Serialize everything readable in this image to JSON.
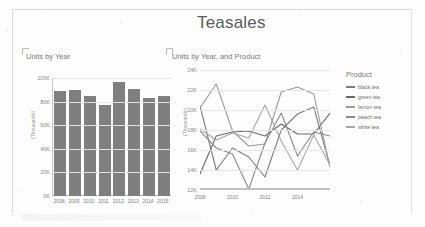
{
  "report": {
    "title": "Teasales"
  },
  "bar_panel": {
    "title": "Units by Year",
    "y_axis_label": "(Thousands)"
  },
  "line_panel": {
    "title": "Units by Year, and Product",
    "y_axis_label": "(Thousands)"
  },
  "legend": {
    "title": "Product",
    "items": [
      {
        "label": "black tea",
        "color": "#7d7d7d"
      },
      {
        "label": "green tea",
        "color": "#6a6a6a"
      },
      {
        "label": "lemon tea",
        "color": "#9a9a9a"
      },
      {
        "label": "peach tea",
        "color": "#8a8a8a"
      },
      {
        "label": "white tea",
        "color": "#a8a8a8"
      }
    ]
  },
  "chart_data": [
    {
      "id": "units-by-year",
      "type": "bar",
      "title": "Units by Year",
      "xlabel": "",
      "ylabel": "(Thousands)",
      "categories": [
        "2008",
        "2009",
        "2010",
        "2011",
        "2012",
        "2013",
        "2014",
        "2015"
      ],
      "values": [
        89000,
        90000,
        85000,
        77000,
        97000,
        91000,
        83000,
        85000
      ],
      "ylim": [
        0,
        100000
      ],
      "yticks": [
        0,
        20000,
        40000,
        60000,
        80000,
        100000
      ],
      "ytick_labels": [
        "0K",
        "20K",
        "40K",
        "60K",
        "80K",
        "100K"
      ],
      "grid": true,
      "bar_color": "#7f7f7f",
      "legend": false
    },
    {
      "id": "units-by-year-and-product",
      "type": "line",
      "title": "Units by Year, and Product",
      "xlabel": "",
      "ylabel": "(Thousands)",
      "x": [
        "2008",
        "2009",
        "2010",
        "2011",
        "2012",
        "2013",
        "2014",
        "2015"
      ],
      "xtick_labels": [
        "2008",
        "2010",
        "2012",
        "2014"
      ],
      "ylim": [
        12000,
        24000
      ],
      "yticks": [
        12000,
        14000,
        16000,
        18000,
        20000,
        22000,
        24000
      ],
      "ytick_labels": [
        "12K",
        "14K",
        "16K",
        "18K",
        "20K",
        "22K",
        "24K"
      ],
      "grid": true,
      "legend": true,
      "legend_position": "right",
      "legend_title": "Product",
      "series": [
        {
          "name": "black tea",
          "color": "#7d7d7d",
          "values": [
            20400,
            14000,
            16200,
            15300,
            13300,
            18000,
            19600,
            20300
          ]
        },
        {
          "name": "green tea",
          "color": "#6a6a6a",
          "values": [
            13600,
            17400,
            17800,
            17900,
            17400,
            18600,
            17600,
            17600
          ]
        },
        {
          "name": "lemon tea",
          "color": "#9a9a9a",
          "values": [
            20200,
            22600,
            17900,
            16400,
            16600,
            21800,
            22300,
            21600
          ]
        },
        {
          "name": "peach tea",
          "color": "#8a8a8a",
          "values": [
            17900,
            16200,
            15600,
            12100,
            16700,
            19700,
            15400,
            17800
          ]
        },
        {
          "name": "white tea",
          "color": "#a8a8a8",
          "values": [
            18100,
            17000,
            17700,
            17200,
            20500,
            16900,
            14000,
            17500
          ]
        }
      ],
      "series_tail": {
        "black tea": 14400,
        "green tea": 19700,
        "lemon tea": 14300,
        "peach tea": 17400,
        "white tea": 14500
      }
    }
  ]
}
